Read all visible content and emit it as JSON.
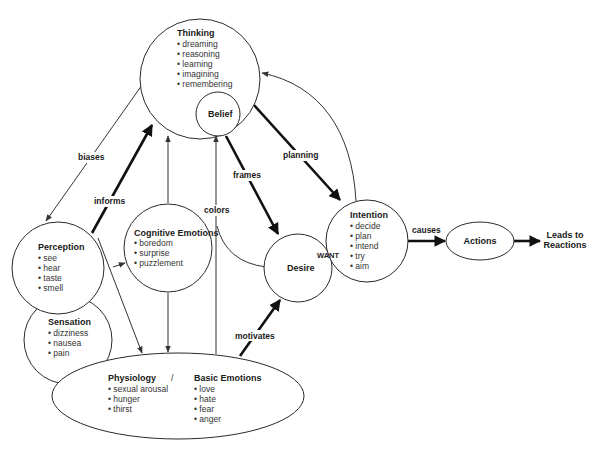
{
  "diagram": {
    "nodes": {
      "thinking": {
        "title": "Thinking",
        "items": [
          "• dreaming",
          "• reasoning",
          "• learning",
          "• imagining",
          "• remembering"
        ]
      },
      "belief": {
        "title": "Belief"
      },
      "perception": {
        "title": "Perception",
        "items": [
          "• see",
          "• hear",
          "• taste",
          "• smell"
        ]
      },
      "sensation": {
        "title": "Sensation",
        "items": [
          "• dizziness",
          "• nausea",
          "• pain"
        ]
      },
      "cognitive_emotions": {
        "title": "Cognitive Emotions",
        "items": [
          "• boredom",
          "• surprise",
          "• puzzlement"
        ]
      },
      "physiology": {
        "title": "Physiology",
        "separator": "/",
        "items": [
          "• sexual arousal",
          "• hunger",
          "• thirst"
        ]
      },
      "basic_emotions": {
        "title": "Basic Emotions",
        "items": [
          "• love",
          "• hate",
          "• fear",
          "• anger"
        ]
      },
      "desire": {
        "title": "Desire"
      },
      "intention": {
        "title": "Intention",
        "items": [
          "• decide",
          "• plan",
          "• intend",
          "• try",
          "• aim"
        ]
      },
      "actions": {
        "title": "Actions"
      },
      "reactions": {
        "line1": "Leads to",
        "line2": "Reactions"
      }
    },
    "edges": {
      "biases": "biases",
      "informs": "informs",
      "colors": "colors",
      "frames": "frames",
      "planning": "planning",
      "motivates": "motivates",
      "want": "WANT",
      "causes": "causes"
    }
  }
}
